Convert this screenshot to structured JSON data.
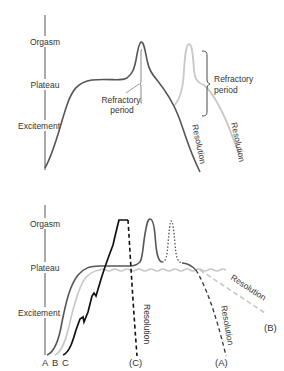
{
  "top_diagram": {
    "axis_labels": {
      "orgasm": "Orgasm",
      "plateau": "Plateau",
      "excitement": "Excitement"
    },
    "annotations": {
      "refractory_1_line1": "Refractory",
      "refractory_1_line2": "period",
      "refractory_2_line1": "Refractory",
      "refractory_2_line2": "period",
      "resolution_1": "Resolution",
      "resolution_2": "Resolution"
    },
    "colors": {
      "main_curve": "#555555",
      "second_curve": "#c8c8c8"
    }
  },
  "bottom_diagram": {
    "axis_labels": {
      "orgasm": "Orgasm",
      "plateau": "Plateau",
      "excitement": "Excitement"
    },
    "start_labels": {
      "a": "A",
      "b": "B",
      "c": "C"
    },
    "end_labels": {
      "c": "(C)",
      "a": "(A)",
      "b": "(B)"
    },
    "resolution_labels": {
      "c": "Resolution",
      "a": "Resolution",
      "b": "Resolution"
    },
    "colors": {
      "pattern_a": "#555555",
      "pattern_b": "#c8c8c8",
      "pattern_c": "#111111"
    }
  }
}
